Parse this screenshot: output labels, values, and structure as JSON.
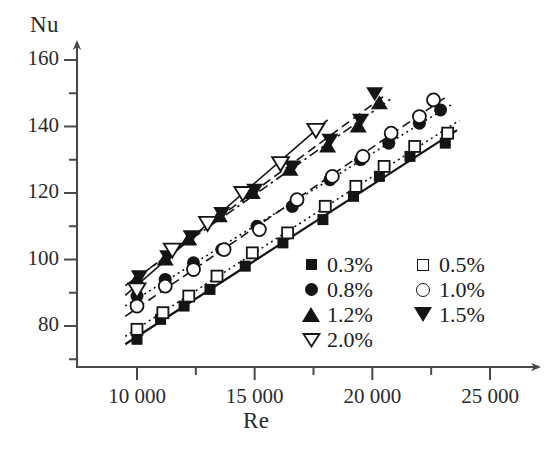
{
  "chart_data": {
    "type": "scatter",
    "title": "",
    "xlabel": "Re",
    "ylabel": "Nu",
    "xlim": [
      7500,
      26500
    ],
    "ylim": [
      66,
      167
    ],
    "grid": false,
    "legend_position": "inside-lower-right",
    "x_ticks": [
      {
        "value": 10000,
        "label": "10 000"
      },
      {
        "value": 15000,
        "label": "15 000"
      },
      {
        "value": 20000,
        "label": "20 000"
      },
      {
        "value": 25000,
        "label": "25 000"
      }
    ],
    "x_minor_ticks": [
      12500,
      17500,
      22500
    ],
    "y_ticks": [
      {
        "value": 80,
        "label": "80"
      },
      {
        "value": 100,
        "label": "100"
      },
      {
        "value": 120,
        "label": "120"
      },
      {
        "value": 140,
        "label": "140"
      },
      {
        "value": 160,
        "label": "160"
      }
    ],
    "y_minor_ticks": [
      70,
      90,
      110,
      130,
      150
    ],
    "series": [
      {
        "name": "0.3%",
        "label": "0.3%",
        "marker": "filled-square",
        "line": "solid",
        "color": "#141414",
        "points": [
          {
            "x": 10000,
            "y": 76
          },
          {
            "x": 11000,
            "y": 82
          },
          {
            "x": 12000,
            "y": 86
          },
          {
            "x": 13100,
            "y": 91
          },
          {
            "x": 14600,
            "y": 98
          },
          {
            "x": 16200,
            "y": 105
          },
          {
            "x": 17900,
            "y": 112
          },
          {
            "x": 19200,
            "y": 119
          },
          {
            "x": 20300,
            "y": 125
          },
          {
            "x": 21600,
            "y": 131
          },
          {
            "x": 23100,
            "y": 135
          }
        ]
      },
      {
        "name": "0.5%",
        "label": "0.5%",
        "marker": "open-square",
        "line": "dotted",
        "color": "#141414",
        "points": [
          {
            "x": 10000,
            "y": 79
          },
          {
            "x": 11100,
            "y": 84
          },
          {
            "x": 12200,
            "y": 89
          },
          {
            "x": 13400,
            "y": 95
          },
          {
            "x": 14900,
            "y": 102
          },
          {
            "x": 16400,
            "y": 108
          },
          {
            "x": 18000,
            "y": 116
          },
          {
            "x": 19300,
            "y": 122
          },
          {
            "x": 20500,
            "y": 128
          },
          {
            "x": 21800,
            "y": 134
          },
          {
            "x": 23200,
            "y": 138
          }
        ]
      },
      {
        "name": "0.8%",
        "label": "0.8%",
        "marker": "filled-circle",
        "line": "dotted",
        "color": "#141414",
        "points": [
          {
            "x": 10000,
            "y": 89
          },
          {
            "x": 11200,
            "y": 94
          },
          {
            "x": 12400,
            "y": 99
          },
          {
            "x": 13600,
            "y": 103
          },
          {
            "x": 15100,
            "y": 110
          },
          {
            "x": 16600,
            "y": 116
          },
          {
            "x": 18200,
            "y": 124
          },
          {
            "x": 19500,
            "y": 130
          },
          {
            "x": 20700,
            "y": 135
          },
          {
            "x": 22000,
            "y": 141
          },
          {
            "x": 22900,
            "y": 145
          }
        ]
      },
      {
        "name": "1.0%",
        "label": "1.0%",
        "marker": "open-circle",
        "line": "dashed",
        "color": "#141414",
        "points": [
          {
            "x": 10000,
            "y": 86
          },
          {
            "x": 11200,
            "y": 92
          },
          {
            "x": 12400,
            "y": 97
          },
          {
            "x": 13700,
            "y": 103
          },
          {
            "x": 15200,
            "y": 109
          },
          {
            "x": 16800,
            "y": 118
          },
          {
            "x": 18300,
            "y": 125
          },
          {
            "x": 19600,
            "y": 131
          },
          {
            "x": 20800,
            "y": 138
          },
          {
            "x": 22000,
            "y": 143
          },
          {
            "x": 22600,
            "y": 148
          }
        ]
      },
      {
        "name": "1.2%",
        "label": "1.2%",
        "marker": "filled-triangle-up",
        "line": "dash-dot",
        "color": "#141414",
        "points": [
          {
            "x": 10000,
            "y": 94
          },
          {
            "x": 11200,
            "y": 100
          },
          {
            "x": 12200,
            "y": 106
          },
          {
            "x": 13500,
            "y": 113
          },
          {
            "x": 14900,
            "y": 120
          },
          {
            "x": 16500,
            "y": 127
          },
          {
            "x": 18100,
            "y": 134
          },
          {
            "x": 19400,
            "y": 140
          },
          {
            "x": 20300,
            "y": 147
          }
        ]
      },
      {
        "name": "1.5%",
        "label": "1.5%",
        "marker": "filled-triangle-down",
        "line": "dashed",
        "color": "#141414",
        "points": [
          {
            "x": 10100,
            "y": 95
          },
          {
            "x": 11300,
            "y": 101
          },
          {
            "x": 12300,
            "y": 107
          },
          {
            "x": 13600,
            "y": 114
          },
          {
            "x": 15000,
            "y": 121
          },
          {
            "x": 16600,
            "y": 128
          },
          {
            "x": 18200,
            "y": 136
          },
          {
            "x": 19500,
            "y": 142
          },
          {
            "x": 20100,
            "y": 150
          }
        ]
      },
      {
        "name": "2.0%",
        "label": "2.0%",
        "marker": "open-triangle-down",
        "line": "solid-thin",
        "color": "#141414",
        "points": [
          {
            "x": 10000,
            "y": 91
          },
          {
            "x": 11500,
            "y": 103
          },
          {
            "x": 13000,
            "y": 111
          },
          {
            "x": 14500,
            "y": 120
          },
          {
            "x": 16100,
            "y": 129
          },
          {
            "x": 17600,
            "y": 139
          }
        ]
      }
    ]
  },
  "legend": {
    "left_column": [
      {
        "label": "0.3%",
        "marker": "filled-square"
      },
      {
        "label": "0.8%",
        "marker": "filled-circle"
      },
      {
        "label": "1.2%",
        "marker": "filled-triangle-up"
      },
      {
        "label": "2.0%",
        "marker": "open-triangle-down"
      }
    ],
    "right_column": [
      {
        "label": "0.5%",
        "marker": "open-square"
      },
      {
        "label": "1.0%",
        "marker": "open-circle"
      },
      {
        "label": "1.5%",
        "marker": "filled-triangle-down"
      }
    ]
  },
  "colors": {
    "ink": "#141414",
    "axis": "#4a4a4a",
    "background": "#ffffff"
  }
}
